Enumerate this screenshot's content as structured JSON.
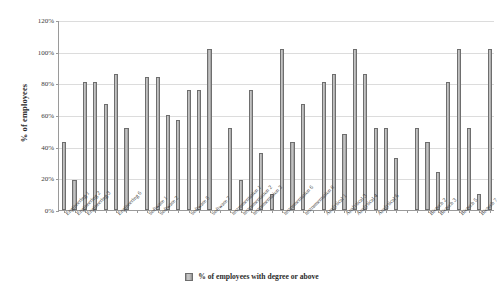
{
  "chart_data": {
    "type": "bar",
    "title": "",
    "xlabel": "",
    "ylabel": "% of employees",
    "ylim": [
      0,
      120
    ],
    "yticks": [
      0,
      20,
      40,
      60,
      80,
      100,
      120
    ],
    "ytick_labels": [
      "0%",
      "20%",
      "40%",
      "60%",
      "80%",
      "100%",
      "120%"
    ],
    "grid": true,
    "legend_position": "bottom",
    "series": [
      {
        "name": "% of employees with degree or above",
        "color": "#b0b0b0",
        "values": [
          43,
          19,
          81,
          81,
          67,
          86,
          52,
          84,
          84,
          60,
          57,
          76,
          76,
          102,
          52,
          19,
          76,
          36,
          10,
          102,
          43,
          67,
          81,
          86,
          48,
          102,
          86,
          52,
          52,
          33,
          52,
          43,
          24,
          81,
          102,
          52,
          10,
          102
        ]
      }
    ],
    "categories": [
      "Engineering 1",
      "Engineering 2",
      "Engineering 3",
      "Engineering 4",
      "Engineering 5",
      "Engineering 6",
      "Engineering 7",
      "Software 1",
      "Software 2",
      "Software 3",
      "Software 4",
      "Software 5",
      "Software 6",
      "Software 7",
      "Instrumentation 1",
      "Instrumentation 2",
      "Instrumentation 3",
      "Instrumentation 4",
      "Instrumentation 5",
      "Instrumentation 6",
      "Instrumentation 7",
      "Instrumentation 8",
      "Analytical 1",
      "Analytical 2",
      "Analytical 3",
      "Analytical 4",
      "Analytical 5",
      "Analytical 6",
      "Analytical 7",
      "Analytical 8",
      "Biotech 1",
      "Biotech 2",
      "Biotech 3",
      "Biotech 4",
      "Biotech 5",
      "Biotech 6",
      "Biotech 7",
      "Biotech 8"
    ],
    "visible_tick_labels": [
      "Engineering 1",
      "Engineering 2",
      "Engineering 3",
      "Engineering 6",
      "Software 1",
      "Software 2",
      "Software 5",
      "Software 7",
      "Instrumentation 1",
      "Instrumentation 2",
      "Instrumentation 3",
      "Instrumentation 6",
      "Instrumentation 8",
      "Analytical 1",
      "Analytical 3",
      "Analytical 4",
      "Analytical 6",
      "Biotech 2",
      "Biotech 3",
      "Biotech 5",
      "Biotech 7"
    ],
    "groups": [
      {
        "name": "Engineering",
        "count": 7
      },
      {
        "name": "Software",
        "count": 7
      },
      {
        "name": "Instrumentation",
        "count": 8
      },
      {
        "name": "Analytical",
        "count": 8
      },
      {
        "name": "Biotech",
        "count": 8
      }
    ]
  },
  "legend": {
    "label": "% of employees with degree or above"
  },
  "axes": {
    "y_title": "% of employees"
  }
}
